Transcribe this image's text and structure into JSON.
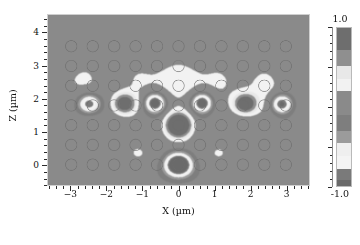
{
  "figure": {
    "type": "field-map",
    "background": "#ffffff"
  },
  "axes": {
    "x_title": "X (µm)",
    "y_title": "Z (µm)",
    "x_ticks": [
      "-3",
      "-2",
      "-1",
      "0",
      "1",
      "2",
      "3"
    ],
    "y_ticks": [
      "0",
      "1",
      "2",
      "3",
      "4"
    ],
    "x_range": [
      -3.65,
      3.65
    ],
    "y_range": [
      -0.62,
      4.55
    ],
    "frame_color": "#cfcfcf"
  },
  "colorbar": {
    "label_top": "1.0",
    "label_bottom": "-1.0",
    "vmin": -1.0,
    "vmax": 1.0,
    "bands": [
      {
        "value": 1.0,
        "color": "#6e6e6e"
      },
      {
        "value": 0.72,
        "color": "#8f8f8f"
      },
      {
        "value": 0.52,
        "color": "#e8e8e8"
      },
      {
        "value": 0.36,
        "color": "#f2f2f2"
      },
      {
        "value": 0.2,
        "color": "#8a8a8a"
      },
      {
        "value": -0.1,
        "color": "#7e7e7e"
      },
      {
        "value": -0.3,
        "color": "#9b9b9b"
      },
      {
        "value": -0.46,
        "color": "#efefef"
      },
      {
        "value": -0.62,
        "color": "#f4f4f4"
      },
      {
        "value": -0.78,
        "color": "#7a7a7a"
      },
      {
        "value": -0.92,
        "color": "#6a6a6a"
      },
      {
        "value": -1.0,
        "color": "#5e5e5e"
      }
    ]
  },
  "chart_data": {
    "type": "heatmap",
    "title": "",
    "xlabel": "X (µm)",
    "ylabel": "Z (µm)",
    "xlim": [
      -3.65,
      3.65
    ],
    "ylim": [
      -0.62,
      4.55
    ],
    "zlim": [
      -1.0,
      1.0
    ],
    "grid": false,
    "legend": "colorbar-right",
    "background_value": 0.0,
    "background_color": "#9a9a9a",
    "lattice": {
      "description": "square array of etched holes outlined as rings",
      "x_start": -3.0,
      "x_step": 0.6,
      "n_cols": 11,
      "z_rows": [
        0.0,
        0.6,
        1.2,
        1.8,
        2.4,
        3.0,
        3.6
      ],
      "hole_radius_um": 0.16,
      "ring_color": "#8b8b8b"
    },
    "features": [
      {
        "name": "central-bright-source",
        "x": 0.0,
        "z": 1.2,
        "value": 1.0,
        "radius_um": 0.3,
        "color": "#fbfbfb"
      },
      {
        "name": "lower-dark-lobe",
        "x": 0.0,
        "z": 0.0,
        "value": -0.95,
        "radius_um": 0.34,
        "color": "#4a4a4a"
      },
      {
        "name": "upper-left-dark-lobe",
        "x": -0.62,
        "z": 1.85,
        "value": -0.8,
        "radius_um": 0.26,
        "color": "#565656"
      },
      {
        "name": "upper-right-dark-lobe",
        "x": 0.62,
        "z": 1.85,
        "value": -0.8,
        "radius_um": 0.26,
        "color": "#565656"
      },
      {
        "name": "left-dark-lobe-a",
        "x": -2.48,
        "z": 1.85,
        "value": -0.78,
        "radius_um": 0.3,
        "color": "#565656"
      },
      {
        "name": "left-bright-lobe",
        "x": -1.55,
        "z": 1.85,
        "value": 0.7,
        "radius_um": 0.28,
        "color": "#8d8d8d"
      },
      {
        "name": "right-bright-ring-lobe",
        "x": 1.85,
        "z": 1.85,
        "value": 0.72,
        "radius_um": 0.28,
        "color": "#8d8d8d"
      },
      {
        "name": "right-dark-lobe",
        "x": 2.85,
        "z": 1.85,
        "value": -0.76,
        "radius_um": 0.26,
        "color": "#5a5a5a"
      },
      {
        "name": "halo-row-z24",
        "x": 0.0,
        "z": 2.45,
        "value": 0.35,
        "radius_um": 1.2,
        "color": "#a8a8a8"
      }
    ]
  }
}
